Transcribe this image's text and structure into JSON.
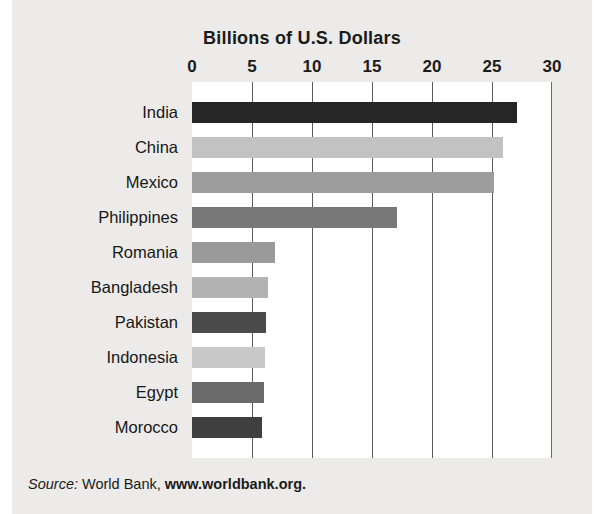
{
  "chart_data": {
    "type": "bar",
    "orientation": "horizontal",
    "title": "Billions of U.S. Dollars",
    "xlabel": "",
    "ylabel": "",
    "xlim": [
      0,
      30
    ],
    "xticks": [
      "0",
      "5",
      "10",
      "15",
      "20",
      "25",
      "30"
    ],
    "xtick_values": [
      0,
      5,
      10,
      15,
      20,
      25,
      30
    ],
    "grid": true,
    "legend": "none",
    "categories": [
      "India",
      "China",
      "Mexico",
      "Philippines",
      "Romania",
      "Bangladesh",
      "Pakistan",
      "Indonesia",
      "Egypt",
      "Morocco"
    ],
    "values": [
      27.1,
      25.9,
      25.2,
      17.1,
      6.9,
      6.3,
      6.2,
      6.1,
      6.0,
      5.8
    ],
    "bar_colors": [
      "#262626",
      "#c2c2c2",
      "#9d9d9d",
      "#787878",
      "#9a9a9a",
      "#b3b3b3",
      "#4b4b4b",
      "#c8c8c8",
      "#6b6b6b",
      "#3f3f3f"
    ],
    "bars": [
      {
        "label": "India",
        "value": 27.1,
        "color": "#262626"
      },
      {
        "label": "China",
        "value": 25.9,
        "color": "#c2c2c2"
      },
      {
        "label": "Mexico",
        "value": 25.2,
        "color": "#9d9d9d"
      },
      {
        "label": "Philippines",
        "value": 17.1,
        "color": "#787878"
      },
      {
        "label": "Romania",
        "value": 6.9,
        "color": "#9a9a9a"
      },
      {
        "label": "Bangladesh",
        "value": 6.3,
        "color": "#b3b3b3"
      },
      {
        "label": "Pakistan",
        "value": 6.2,
        "color": "#4b4b4b"
      },
      {
        "label": "Indonesia",
        "value": 6.1,
        "color": "#c8c8c8"
      },
      {
        "label": "Egypt",
        "value": 6.0,
        "color": "#6b6b6b"
      },
      {
        "label": "Morocco",
        "value": 5.8,
        "color": "#3f3f3f"
      }
    ]
  },
  "source": {
    "prefix": "Source:",
    "organization": "World Bank,",
    "url": "www.worldbank.org."
  },
  "colors": {
    "page_background": "#ecebe9",
    "plot_background": "#ffffff",
    "gridline": "#5b5b5b",
    "text": "#1b1b1b"
  }
}
